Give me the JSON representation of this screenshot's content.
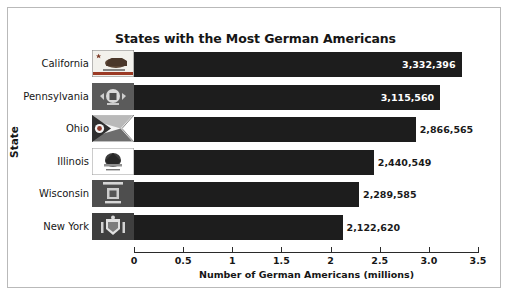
{
  "chart_data": {
    "type": "bar",
    "orientation": "horizontal",
    "title": "States with the Most German Americans",
    "xlabel": "Number of German Americans (millions)",
    "ylabel": "State",
    "categories": [
      "California",
      "Pennsylvania",
      "Ohio",
      "Illinois",
      "Wisconsin",
      "New York"
    ],
    "values": [
      3332396,
      3115560,
      2866565,
      2440549,
      2289585,
      2122620
    ],
    "value_labels": [
      "3,332,396",
      "3,115,560",
      "2,866,565",
      "2,440,549",
      "2,289,585",
      "2,122,620"
    ],
    "xlim": [
      0,
      3.5
    ],
    "xticks": [
      0,
      0.5,
      1,
      1.5,
      2,
      2.5,
      3.0,
      3.5
    ],
    "xtick_labels": [
      "0",
      "0.5",
      "1",
      "1.5",
      "2",
      "2.5",
      "3.0",
      "3.5"
    ],
    "grid": false,
    "legend": false,
    "bar_color": "#1d1d1d",
    "value_unit": "millions",
    "bars": [
      {
        "category": "California",
        "value": 3332396,
        "value_millions": 3.332396,
        "label": "3,332,396",
        "label_position": "inside",
        "flag_name": "california-state-flag"
      },
      {
        "category": "Pennsylvania",
        "value": 3115560,
        "value_millions": 3.11556,
        "label": "3,115,560",
        "label_position": "inside",
        "flag_name": "pennsylvania-state-flag"
      },
      {
        "category": "Ohio",
        "value": 2866565,
        "value_millions": 2.866565,
        "label": "2,866,565",
        "label_position": "outside",
        "flag_name": "ohio-state-flag"
      },
      {
        "category": "Illinois",
        "value": 2440549,
        "value_millions": 2.440549,
        "label": "2,440,549",
        "label_position": "outside",
        "flag_name": "illinois-state-flag"
      },
      {
        "category": "Wisconsin",
        "value": 2289585,
        "value_millions": 2.289585,
        "label": "2,289,585",
        "label_position": "outside",
        "flag_name": "wisconsin-state-flag"
      },
      {
        "category": "New York",
        "value": 2122620,
        "value_millions": 2.12262,
        "label": "2,122,620",
        "label_position": "outside",
        "flag_name": "new-york-state-flag"
      }
    ]
  },
  "chart": {
    "title": "States with the Most German Americans",
    "x_axis_title": "Number of German Americans (millions)",
    "y_axis_title": "State"
  },
  "categories": {
    "0": {
      "label": "California"
    },
    "1": {
      "label": "Pennsylvania"
    },
    "2": {
      "label": "Ohio"
    },
    "3": {
      "label": "Illinois"
    },
    "4": {
      "label": "Wisconsin"
    },
    "5": {
      "label": "New York"
    }
  },
  "values": {
    "0": {
      "label": "3,332,396"
    },
    "1": {
      "label": "3,115,560"
    },
    "2": {
      "label": "2,866,565"
    },
    "3": {
      "label": "2,440,549"
    },
    "4": {
      "label": "2,289,585"
    },
    "5": {
      "label": "2,122,620"
    }
  },
  "xticks": {
    "0": {
      "label": "0"
    },
    "1": {
      "label": "0.5"
    },
    "2": {
      "label": "1"
    },
    "3": {
      "label": "1.5"
    },
    "4": {
      "label": "2"
    },
    "5": {
      "label": "2.5"
    },
    "6": {
      "label": "3.0"
    },
    "7": {
      "label": "3.5"
    }
  }
}
